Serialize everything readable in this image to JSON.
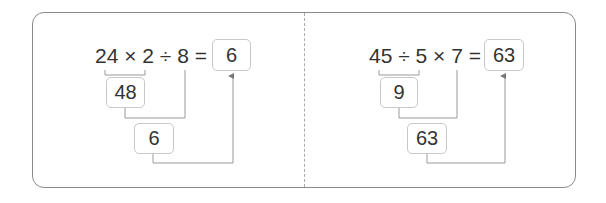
{
  "problems": [
    {
      "expression": "24 × 2 ÷ 8 =",
      "answer": "6",
      "step1_result": "48",
      "step2_result": "6"
    },
    {
      "expression": "45 ÷ 5 × 7 =",
      "answer": "63",
      "step1_result": "9",
      "step2_result": "63"
    }
  ],
  "colors": {
    "border": "#8a8a8a",
    "line": "#9a9a9a",
    "text": "#333333"
  }
}
